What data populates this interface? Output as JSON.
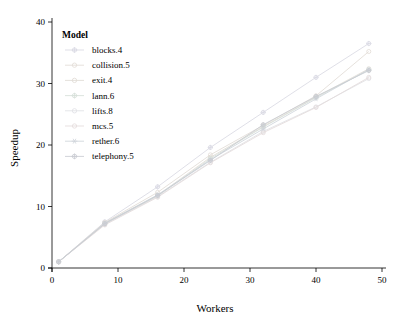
{
  "chart_data": {
    "type": "line",
    "title": "",
    "xlabel": "Workers",
    "ylabel": "Speedup",
    "xlim": [
      0,
      50
    ],
    "ylim": [
      0,
      40
    ],
    "xticks": [
      0,
      10,
      20,
      30,
      40,
      50
    ],
    "yticks": [
      0,
      10,
      20,
      30,
      40
    ],
    "grid": false,
    "legend_position": "top-left-inside",
    "legend_title": "Model",
    "x": [
      1,
      8,
      16,
      24,
      32,
      40,
      48
    ],
    "series": [
      {
        "name": "blocks.4",
        "color": "#d9d9e3",
        "marker": "circle-plus",
        "values": [
          1,
          7.5,
          13.2,
          19.6,
          25.3,
          31.0,
          36.5
        ]
      },
      {
        "name": "collision.5",
        "color": "#e2dcd6",
        "marker": "circle",
        "values": [
          1,
          7.4,
          12.3,
          18.4,
          23.2,
          28.0,
          35.2
        ]
      },
      {
        "name": "exit.4",
        "color": "#e0dbd4",
        "marker": "circle",
        "values": [
          1,
          7.3,
          11.8,
          18.0,
          23.0,
          27.8,
          32.4
        ]
      },
      {
        "name": "lann.6",
        "color": "#d7dfd9",
        "marker": "circle-plus",
        "values": [
          1,
          7.2,
          11.7,
          17.8,
          22.9,
          27.7,
          32.2
        ]
      },
      {
        "name": "lifts.8",
        "color": "#dfe0e4",
        "marker": "circle",
        "values": [
          1,
          7.1,
          11.6,
          17.2,
          22.2,
          26.2,
          30.8
        ]
      },
      {
        "name": "mcs.5",
        "color": "#e4dcdc",
        "marker": "circle",
        "values": [
          1,
          7.0,
          11.5,
          17.1,
          22.0,
          26.1,
          31.0
        ]
      },
      {
        "name": "rether.6",
        "color": "#cfd4da",
        "marker": "asterisk",
        "values": [
          1,
          7.3,
          11.9,
          17.6,
          22.6,
          27.5,
          32.3
        ]
      },
      {
        "name": "telephony.5",
        "color": "#c9ccd2",
        "marker": "circle-plus",
        "values": [
          1,
          7.2,
          11.8,
          17.5,
          23.3,
          27.9,
          32.1
        ]
      }
    ]
  },
  "axes": {
    "x_title": "Workers",
    "y_title": "Speedup",
    "x_tick_labels": [
      "0",
      "10",
      "20",
      "30",
      "40",
      "50"
    ],
    "y_tick_labels": [
      "0",
      "10",
      "20",
      "30",
      "40"
    ]
  },
  "legend": {
    "title": "Model",
    "items": [
      {
        "label": "blocks.4"
      },
      {
        "label": "collision.5"
      },
      {
        "label": "exit.4"
      },
      {
        "label": "lann.6"
      },
      {
        "label": "lifts.8"
      },
      {
        "label": "mcs.5"
      },
      {
        "label": "rether.6"
      },
      {
        "label": "telephony.5"
      }
    ]
  }
}
